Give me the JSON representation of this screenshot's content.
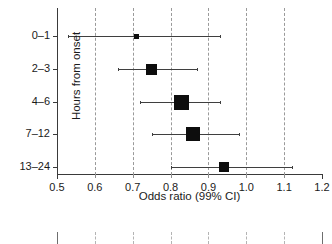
{
  "chart_data": {
    "type": "scatter",
    "plot_kind": "forest-plot",
    "title": "",
    "xlabel": "Odds ratio (99% CI)",
    "ylabel": "Hours from onset",
    "xlim": [
      0.5,
      1.2
    ],
    "xticks": [
      0.5,
      0.6,
      0.7,
      0.8,
      0.9,
      1.0,
      1.1,
      1.2
    ],
    "xticklabels": [
      "0.5",
      "0.6",
      "0.7",
      "0.8",
      "0.9",
      "1.0",
      "1.1",
      "1.2"
    ],
    "grid": "vertical-dashed-at-0.6-to-1.1",
    "legend": null,
    "categories": [
      "0–1",
      "2–3",
      "4–6",
      "7–12",
      "13–24"
    ],
    "series": [
      {
        "name": "Odds ratio",
        "points": [
          {
            "category": "0–1",
            "value": 0.71,
            "ci_low": 0.53,
            "ci_high": 0.93,
            "marker_size": 5
          },
          {
            "category": "2–3",
            "value": 0.75,
            "ci_low": 0.66,
            "ci_high": 0.87,
            "marker_size": 11
          },
          {
            "category": "4–6",
            "value": 0.83,
            "ci_low": 0.72,
            "ci_high": 0.93,
            "marker_size": 15
          },
          {
            "category": "7–12",
            "value": 0.86,
            "ci_low": 0.75,
            "ci_high": 0.98,
            "marker_size": 14
          },
          {
            "category": "13–24",
            "value": 0.94,
            "ci_low": 0.8,
            "ci_high": 1.12,
            "marker_size": 10
          }
        ]
      }
    ]
  },
  "lower_panel": {
    "note": "cropped top edge of a second panel",
    "gridlines": [
      0.6,
      0.7,
      0.8,
      0.9,
      1.0,
      1.1
    ],
    "edges": [
      0.5,
      1.2
    ]
  }
}
